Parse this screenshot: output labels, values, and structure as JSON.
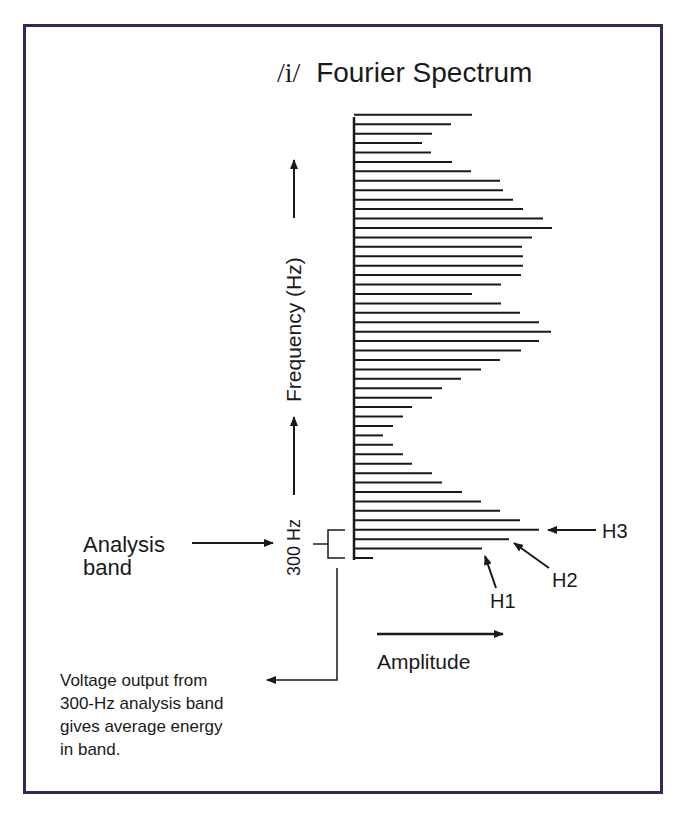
{
  "title": {
    "phoneme": "/i/",
    "text": "Fourier Spectrum"
  },
  "labels": {
    "frequency_axis": "Frequency (Hz)",
    "amplitude_axis": "Amplitude",
    "bandwidth": "300 Hz",
    "analysis_band_line1": "Analysis",
    "analysis_band_line2": "band",
    "h1": "H1",
    "h2": "H2",
    "h3": "H3",
    "voltage_line1": "Voltage output from",
    "voltage_line2": "300-Hz analysis band",
    "voltage_line3": "gives average energy",
    "voltage_line4": "in band."
  },
  "colors": {
    "frame": "#2e2a5a",
    "ink": "#1a1a1a"
  },
  "chart_data": {
    "type": "bar",
    "orientation": "horizontal",
    "title": "/i/ Fourier Spectrum",
    "xlabel": "Amplitude",
    "ylabel": "Frequency (Hz)",
    "note": "Harmonic lines from bottom (H1 region) to top; amplitude in pixels from axis (relative units)",
    "harmonic_labels": {
      "H1": 2,
      "H2": 3,
      "H3": 4
    },
    "values_bottom_to_top": [
      19,
      128,
      155,
      185,
      166,
      146,
      127,
      108,
      88,
      78,
      58,
      49,
      39,
      29,
      39,
      49,
      58,
      78,
      88,
      107,
      127,
      146,
      167,
      185,
      197,
      185,
      166,
      147,
      118,
      147,
      167,
      169,
      169,
      168,
      178,
      198,
      189,
      169,
      159,
      149,
      146,
      117,
      98,
      77,
      68,
      78,
      97,
      118
    ]
  }
}
